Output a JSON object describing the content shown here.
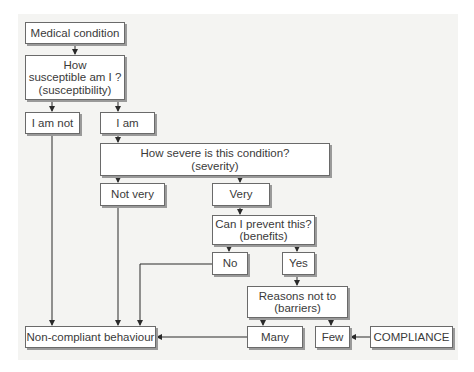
{
  "diagram": {
    "type": "flowchart",
    "nodes": {
      "medical_condition": {
        "label": "Medical condition"
      },
      "susceptible": {
        "line1": "How",
        "line2": "susceptible am I ?",
        "line3": "(susceptibility)"
      },
      "i_am_not": {
        "label": "I am not"
      },
      "i_am": {
        "label": "I am"
      },
      "severe": {
        "line1": "How severe is this condition?",
        "line2": "(severity)"
      },
      "not_very": {
        "label": "Not very"
      },
      "very": {
        "label": "Very"
      },
      "prevent": {
        "line1": "Can I prevent this?",
        "line2": "(benefits)"
      },
      "no": {
        "label": "No"
      },
      "yes": {
        "label": "Yes"
      },
      "reasons": {
        "line1": "Reasons not to",
        "line2": "(barriers)"
      },
      "non_compliant": {
        "label": "Non-compliant behaviour"
      },
      "many": {
        "label": "Many"
      },
      "few": {
        "label": "Few"
      },
      "compliance": {
        "label": "COMPLIANCE"
      }
    },
    "edges": [
      [
        "Medical condition",
        "How susceptible am I?"
      ],
      [
        "How susceptible am I?",
        "I am not"
      ],
      [
        "How susceptible am I?",
        "I am"
      ],
      [
        "I am",
        "How severe is this condition?"
      ],
      [
        "How severe is this condition?",
        "Not very"
      ],
      [
        "How severe is this condition?",
        "Very"
      ],
      [
        "Very",
        "Can I prevent this?"
      ],
      [
        "Can I prevent this?",
        "No"
      ],
      [
        "Can I prevent this?",
        "Yes"
      ],
      [
        "Yes",
        "Reasons not to"
      ],
      [
        "Reasons not to",
        "Many"
      ],
      [
        "Reasons not to",
        "Few"
      ],
      [
        "I am not",
        "Non-compliant behaviour"
      ],
      [
        "Not very",
        "Non-compliant behaviour"
      ],
      [
        "No",
        "Non-compliant behaviour"
      ],
      [
        "Many",
        "Non-compliant behaviour"
      ],
      [
        "COMPLIANCE",
        "Few"
      ]
    ],
    "colors": {
      "line": "#2a2a2a",
      "box_border": "#6a6a6a",
      "text": "#3a3a3a",
      "background": "#f4f4f2"
    }
  }
}
